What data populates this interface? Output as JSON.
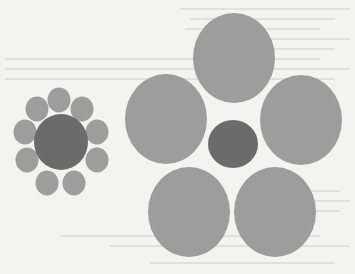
{
  "figure": {
    "colors": {
      "background": "#f3f3f1",
      "surround": "#9d9d9d",
      "center": "#6b6b6b",
      "bleed_text": "#8a8a8a"
    },
    "left_cluster": {
      "name": "small-surround-cluster",
      "surround_count": 10
    },
    "right_cluster": {
      "name": "large-surround-cluster",
      "surround_count": 5
    }
  }
}
